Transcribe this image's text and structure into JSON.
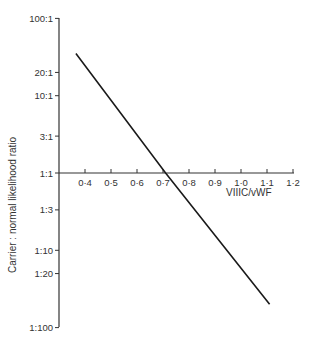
{
  "chart_data": {
    "type": "line",
    "title": "",
    "xlabel": "VIIIC/vWF",
    "ylabel": "Carrier : normal likelihood ratio",
    "x_ticks": [
      "0·4",
      "0·5",
      "0·6",
      "0·7",
      "0·8",
      "0·9",
      "1·0",
      "1·1",
      "1·2"
    ],
    "x_tick_values": [
      0.4,
      0.5,
      0.6,
      0.7,
      0.8,
      0.9,
      1.0,
      1.1,
      1.2
    ],
    "y_ticks": [
      "100:1",
      "20:1",
      "10:1",
      "3:1",
      "1:1",
      "1:3",
      "1:10",
      "1:20",
      "1:100"
    ],
    "y_tick_values": [
      100,
      20,
      10,
      3,
      1,
      0.3333,
      0.1,
      0.05,
      0.01
    ],
    "y_scale": "log",
    "xlim": [
      0.365,
      1.2
    ],
    "ylim": [
      0.01,
      100
    ],
    "grid": false,
    "series": [
      {
        "name": "likelihood ratio",
        "x": [
          0.365,
          0.71,
          1.11
        ],
        "y": [
          35,
          1,
          0.02
        ]
      }
    ]
  }
}
